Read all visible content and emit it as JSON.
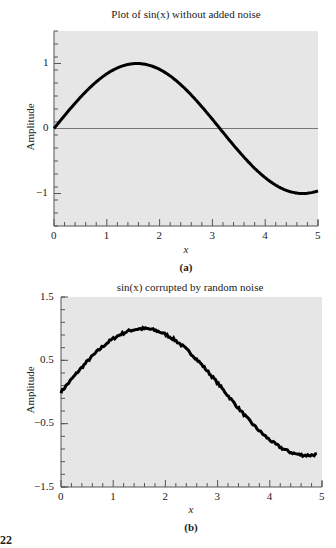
{
  "figure_number": "22",
  "chart_data": [
    {
      "type": "line",
      "panel_label": "(a)",
      "title": "Plot of sin(x) without added noise",
      "xlabel": "x",
      "ylabel": "Amplitude",
      "xlim": [
        0,
        5
      ],
      "ylim": [
        -1.5,
        1.5
      ],
      "xticks": [
        0,
        1,
        2,
        3,
        4,
        5
      ],
      "xtick_labels": [
        "0",
        "1",
        "2",
        "3",
        "4",
        "5"
      ],
      "yticks": [
        -1,
        0,
        1
      ],
      "ytick_labels": [
        "−1",
        "0",
        "1"
      ],
      "minor_ticks": true,
      "grid": false,
      "zero_line": true,
      "background": "#e6e6e6",
      "series": [
        {
          "name": "sin(x)",
          "function": "sin",
          "x_start": 0,
          "x_end": 5,
          "color": "#000000",
          "noise": 0
        }
      ],
      "x": [
        0,
        0.5,
        1,
        1.5,
        1.5708,
        2,
        2.5,
        3,
        3.1416,
        3.5,
        4,
        4.5,
        4.7124,
        5
      ],
      "y": [
        0,
        0.479,
        0.841,
        0.997,
        1.0,
        0.909,
        0.598,
        0.141,
        0,
        -0.351,
        -0.757,
        -0.978,
        -1.0,
        -0.959
      ]
    },
    {
      "type": "line",
      "panel_label": "(b)",
      "title": "sin(x) corrupted by random noise",
      "xlabel": "x",
      "ylabel": "Amplitude",
      "xlim": [
        0,
        5
      ],
      "ylim": [
        -1.5,
        1.5
      ],
      "xticks": [
        0,
        1,
        2,
        3,
        4,
        5
      ],
      "xtick_labels": [
        "0",
        "1",
        "2",
        "3",
        "4",
        "5"
      ],
      "yticks": [
        -1.5,
        -0.5,
        0.5,
        1.5
      ],
      "ytick_labels": [
        "−1.5",
        "−0.5",
        "0.5",
        "1.5"
      ],
      "minor_ticks": true,
      "grid": false,
      "zero_line": false,
      "background": "#e6e6e6",
      "series": [
        {
          "name": "sin(x) + noise",
          "function": "sin",
          "x_start": 0,
          "x_end": 4.9,
          "color": "#000000",
          "noise": 0.02
        }
      ],
      "x": [
        0,
        0.5,
        1,
        1.5,
        1.6,
        2,
        2.5,
        3,
        3.5,
        4,
        4.5,
        4.7,
        4.9
      ],
      "y": [
        0,
        0.49,
        0.85,
        1.0,
        1.02,
        0.91,
        0.6,
        0.14,
        -0.35,
        -0.76,
        -0.97,
        -1.02,
        -0.98
      ]
    }
  ]
}
